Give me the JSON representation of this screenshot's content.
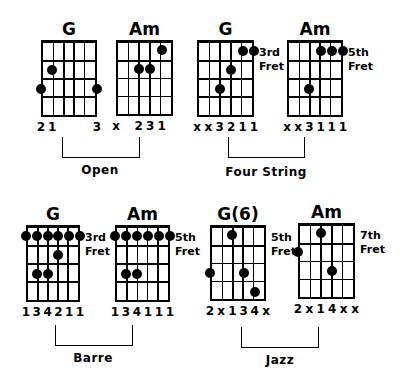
{
  "groups": [
    {
      "label": "Open",
      "bracket": {
        "left": 62,
        "right": 140,
        "top": 137,
        "bottom": 158
      },
      "label_pos": {
        "cx": 100,
        "y": 163
      },
      "chords": [
        {
          "name": "G",
          "grid": {
            "x": 41,
            "y": 41,
            "w": 56,
            "h": 76
          },
          "fret_label": "",
          "dots": [
            [
              1,
              2
            ],
            [
              0,
              3
            ],
            [
              5,
              3
            ]
          ],
          "fingers": [
            "2",
            "1",
            "",
            "",
            "",
            "3"
          ]
        },
        {
          "name": "Am",
          "grid": {
            "x": 116,
            "y": 41,
            "w": 57,
            "h": 75
          },
          "fret_label": "",
          "dots": [
            [
              4,
              1
            ],
            [
              2,
              2
            ],
            [
              3,
              2
            ]
          ],
          "fingers": [
            "x",
            "",
            "2",
            "3",
            "1",
            ""
          ]
        }
      ]
    },
    {
      "label": "Four String",
      "bracket": {
        "left": 228,
        "right": 305,
        "top": 137,
        "bottom": 158
      },
      "label_pos": {
        "cx": 266,
        "y": 165
      },
      "chords": [
        {
          "name": "G",
          "grid": {
            "x": 197,
            "y": 41,
            "w": 57,
            "h": 76
          },
          "fret_label": "3rd\nFret",
          "dots": [
            [
              4,
              1
            ],
            [
              5,
              1
            ],
            [
              3,
              2
            ],
            [
              2,
              3
            ]
          ],
          "fingers": [
            "x",
            "x",
            "3",
            "2",
            "1",
            "1"
          ]
        },
        {
          "name": "Am",
          "grid": {
            "x": 287,
            "y": 41,
            "w": 56,
            "h": 76
          },
          "fret_label": "5th\nFret",
          "dots": [
            [
              3,
              1
            ],
            [
              4,
              1
            ],
            [
              5,
              1
            ],
            [
              2,
              3
            ]
          ],
          "fingers": [
            "x",
            "x",
            "3",
            "1",
            "1",
            "1"
          ]
        }
      ]
    },
    {
      "label": "Barre",
      "bracket": {
        "left": 55,
        "right": 133,
        "top": 325,
        "bottom": 346
      },
      "label_pos": {
        "cx": 93,
        "y": 351
      },
      "chords": [
        {
          "name": "G",
          "grid": {
            "x": 26,
            "y": 226,
            "w": 54,
            "h": 76
          },
          "fret_label": "3rd\nFret",
          "dots": [
            [
              0,
              1
            ],
            [
              1,
              1
            ],
            [
              2,
              1
            ],
            [
              3,
              1
            ],
            [
              4,
              1
            ],
            [
              5,
              1
            ],
            [
              3,
              2
            ],
            [
              1,
              3
            ],
            [
              2,
              3
            ]
          ],
          "fingers": [
            "1",
            "3",
            "4",
            "2",
            "1",
            "1"
          ]
        },
        {
          "name": "Am",
          "grid": {
            "x": 115,
            "y": 226,
            "w": 55,
            "h": 76
          },
          "fret_label": "5th\nFret",
          "dots": [
            [
              0,
              1
            ],
            [
              1,
              1
            ],
            [
              2,
              1
            ],
            [
              3,
              1
            ],
            [
              4,
              1
            ],
            [
              5,
              1
            ],
            [
              1,
              3
            ],
            [
              2,
              3
            ]
          ],
          "fingers": [
            "1",
            "3",
            "4",
            "1",
            "1",
            "1"
          ]
        }
      ]
    },
    {
      "label": "Jazz",
      "bracket": {
        "left": 241,
        "right": 319,
        "top": 327,
        "bottom": 348
      },
      "label_pos": {
        "cx": 280,
        "y": 353
      },
      "chords": [
        {
          "name": "G(6)",
          "grid": {
            "x": 210,
            "y": 226,
            "w": 56,
            "h": 75
          },
          "fret_label": "5th\nFret",
          "dots": [
            [
              2,
              1
            ],
            [
              0,
              3
            ],
            [
              3,
              3
            ],
            [
              4,
              4
            ]
          ],
          "fingers": [
            "2",
            "x",
            "1",
            "3",
            "4",
            "x"
          ]
        },
        {
          "name": "Am",
          "grid": {
            "x": 298,
            "y": 224,
            "w": 57,
            "h": 75
          },
          "fret_label": "7th\nFret",
          "dots": [
            [
              2,
              1
            ],
            [
              0,
              2
            ],
            [
              3,
              3
            ]
          ],
          "fingers": [
            "2",
            "x",
            "1",
            "4",
            "x",
            "x"
          ]
        }
      ]
    }
  ]
}
